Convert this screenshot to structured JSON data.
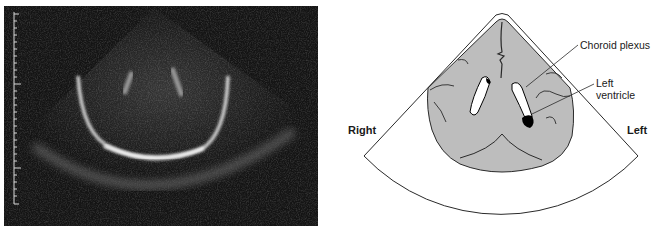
{
  "figure": {
    "left_panel": {
      "type": "ultrasound-scan",
      "description": "Coronal cranial ultrasound image",
      "scale_ruler": {
        "side": "left",
        "major_ticks": 3,
        "minor_ticks_per_major": 10
      }
    },
    "right_panel": {
      "type": "labeled-diagram",
      "labels": {
        "choroid_plexus": "Choroid plexus",
        "left_ventricle_line1": "Left",
        "left_ventricle_line2": "ventricle",
        "side_right": "Right",
        "side_left": "Left"
      }
    }
  },
  "colors": {
    "scan_background": "#141414",
    "brain_fill": "#bdbdbd",
    "line": "#2a2a2a",
    "ventricle_dark": "#000000"
  }
}
